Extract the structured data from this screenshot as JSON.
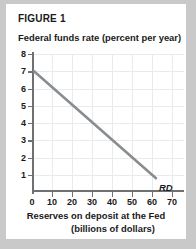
{
  "figure": {
    "label": "FIGURE 1",
    "curve_label": "RD"
  },
  "chart_data": {
    "type": "line",
    "title": "FIGURE 1",
    "ylabel": "Federal funds rate (percent per year)",
    "xlabel_line1": "Reserves on deposit at the Fed",
    "xlabel_line2": "(billions of dollars)",
    "xlim": [
      0,
      76
    ],
    "ylim": [
      0,
      8
    ],
    "xticks": [
      0,
      10,
      20,
      30,
      40,
      50,
      60,
      70
    ],
    "yticks": [
      0,
      1,
      2,
      3,
      4,
      5,
      6,
      7,
      8
    ],
    "grid": true,
    "legend": "none",
    "series": [
      {
        "name": "RD",
        "annotation": "RD",
        "color": "#8a8d90",
        "x": [
          1.0,
          62.0
        ],
        "y": [
          7.0,
          0.8
        ]
      }
    ]
  }
}
